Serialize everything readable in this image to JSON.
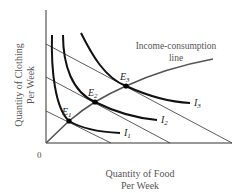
{
  "diagram": {
    "y_axis_label_line1": "Quantity of Clothing",
    "y_axis_label_line2": "Per Week",
    "x_axis_label_line1": "Quantity of Food",
    "x_axis_label_line2": "Per Week",
    "origin_label": "0",
    "icl_label_line1": "Income-consumption",
    "icl_label_line2": "line",
    "equilibria": [
      {
        "label": "E",
        "sub": "1"
      },
      {
        "label": "E",
        "sub": "2"
      },
      {
        "label": "E",
        "sub": "3"
      }
    ],
    "indifference_curves": [
      {
        "label": "I",
        "sub": "1"
      },
      {
        "label": "I",
        "sub": "2"
      },
      {
        "label": "I",
        "sub": "3"
      }
    ],
    "budget_lines_count": 3
  }
}
